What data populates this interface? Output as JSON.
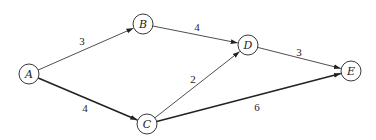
{
  "diagram": {
    "type": "weighted-directed-graph",
    "nodes": [
      {
        "id": "A",
        "label": "A",
        "x": 29,
        "y": 74
      },
      {
        "id": "B",
        "label": "B",
        "x": 143,
        "y": 24
      },
      {
        "id": "C",
        "label": "C",
        "x": 147,
        "y": 124
      },
      {
        "id": "D",
        "label": "D",
        "x": 248,
        "y": 45
      },
      {
        "id": "E",
        "label": "E",
        "x": 351,
        "y": 71
      }
    ],
    "edges": [
      {
        "from": "A",
        "to": "B",
        "weight": "3",
        "thick": false,
        "label_x": 82,
        "label_y": 45
      },
      {
        "from": "A",
        "to": "C",
        "weight": "4",
        "thick": true,
        "label_x": 85,
        "label_y": 112
      },
      {
        "from": "B",
        "to": "D",
        "weight": "4",
        "thick": false,
        "label_x": 197,
        "label_y": 31
      },
      {
        "from": "C",
        "to": "D",
        "weight": "2",
        "thick": false,
        "label_x": 193,
        "label_y": 83
      },
      {
        "from": "D",
        "to": "E",
        "weight": "3",
        "thick": false,
        "label_x": 299,
        "label_y": 56
      },
      {
        "from": "C",
        "to": "E",
        "weight": "6",
        "thick": true,
        "label_x": 257,
        "label_y": 111
      }
    ]
  }
}
